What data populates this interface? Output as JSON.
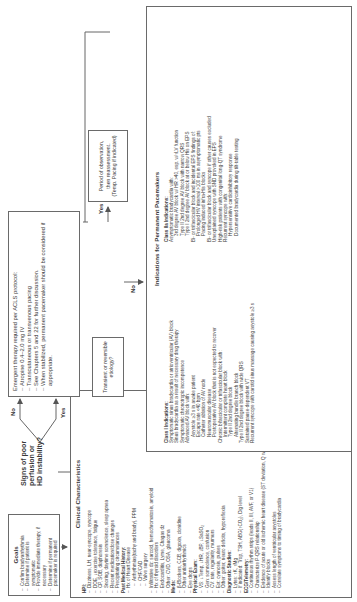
{
  "goals": {
    "title": "Goals",
    "items": [
      "Confirm bradyarrhythmia",
      "Determine if patient is symptomatic",
      "Provide immediate therapy, if necessary",
      "Determine if permanent pacemaker is required"
    ]
  },
  "clinical": {
    "title": "Clinical Characteristics",
    "hpi_label": "HPI:",
    "hpi": [
      "Dizziness, LH, near-syncope, syncope",
      "DOE, ↓exercise tolerance, fatigue",
      "CP, SOB, diaphoresis",
      "Snoring, daytime somnolence, sleep apnea",
      "Recent medication/dose changes",
      "Precipitating circumstances"
    ],
    "pmh_label": "Past Medical History:",
    "pmh": [
      {
        "t": "Hx of Heart Disease",
        "lvl": 1
      },
      {
        "t": "Arrhythmias(tachy and brady), PPM",
        "lvl": 2
      },
      {
        "t": "CHF/CAD",
        "lvl": 2
      },
      {
        "t": "Valve surgery",
        "lvl": 2
      },
      {
        "t": "Infiltrative dz: sarcoid, hemochromatosis, amyloid",
        "lvl": 1
      },
      {
        "t": "Hx of thyroid disorders",
        "lvl": 1
      },
      {
        "t": "Endocarditis, Lyme, Chagas dz",
        "lvl": 1
      },
      {
        "t": "Other: CVD, OSA, glaucoma",
        "lvl": 1
      }
    ],
    "meds_label": "Meds:",
    "meds": [
      "β-Blockers, CCB, digoxin, clonidine",
      "Other antiarrhythmics",
      "Eye drops"
    ],
    "exam_label": "Physical Exam:",
    "exam": [
      "VS: ↓Temp, ↓HR, ↓BP, ↓SaSO₂",
      "Gen: somnolence, confusion",
      "CV: rate, regularity, murmurs",
      "Ext: cyanosis, pulses",
      "Other: goiter, neuro deficits, hyporeflexia"
    ],
    "dx_label": "Diagnostic Studies:",
    "dx": [
      "Lytes: ↑K, ↑Mg",
      "If indicated: Trop, TSH, ABG(↑CO₂), Dig level"
    ],
    "ecg_label": "ECG/Telemetry:",
    "ecg": [
      "Continuous rhythm strips (leads II, III, AVF, or V1)",
      "Characterize P-QRS relationship",
      "Evidence of acute or old ischemic heart disease (ST deviation, Q waves)",
      "Identify blocks",
      "Assess length of ventricular asystoles",
      "Correlate symptoms to timing of bradycardia"
    ]
  },
  "decision": {
    "question": [
      "Signs of poor",
      "perfusion or",
      "HD instability?"
    ],
    "yes_label": "Yes",
    "no_label": "No"
  },
  "emergent": {
    "lead": "Emergent therapy required per ACLS protocol:",
    "items": [
      "Atropine 0.4–2.0 mg IV",
      "Transcutaneous or transvenous pacing",
      "See Chapters 5 and 22 for further discussion.",
      "When stabilized, permanent pacemaker should be considered if appropriate."
    ]
  },
  "transient": {
    "question": "Transient or reversible etiology?",
    "yes_label": "Yes",
    "no_label": "No"
  },
  "observation": {
    "text": [
      "Period of observation,",
      "then reassessment.",
      "(Temp. Pacing if indicated)"
    ]
  },
  "indications": {
    "title": "Indications for Permanent Pacemakers",
    "class1_label": "Class I Indications:",
    "class1": [
      {
        "t": "Symptomatic sinus bradycardia or atrioventricular (AV) block",
        "lvl": 0
      },
      {
        "t": "Sinus bradycardia as a result of necessary drug therapy",
        "lvl": 0
      },
      {
        "t": "Symptomatic chronotropic incompetence",
        "lvl": 0
      },
      {
        "t": "Advanced AV block with:",
        "lvl": 0
      },
      {
        "t": "Asystole ≥3 s in awake patient",
        "lvl": 1
      },
      {
        "t": "Escape rate <40 bpm",
        "lvl": 1
      },
      {
        "t": "Catheter ablation of AV node",
        "lvl": 1
      },
      {
        "t": "Neuromuscular disease",
        "lvl": 1
      },
      {
        "t": "Postoperative AV block that is not expected to recover",
        "lvl": 1
      },
      {
        "t": "Chronic bifascicular or trifascicular block with:",
        "lvl": 0
      },
      {
        "t": "Intermittent complete heart block",
        "lvl": 1
      },
      {
        "t": "Type II 2nd degree block",
        "lvl": 1
      },
      {
        "t": "Alternating bundle branch block",
        "lvl": 1
      },
      {
        "t": "Type II 2nd degree block with wide QRS",
        "lvl": 0
      },
      {
        "t": "Sustained pause-dependent VT",
        "lvl": 0
      },
      {
        "t": "Recurrent syncope with carotid sinus massage causing asystole ≥3 s",
        "lvl": 0
      }
    ],
    "class2a_label": "Class IIa Indications:",
    "class2a": [
      {
        "t": "Asymptomatic bradycardia with:",
        "lvl": 0
      },
      {
        "t": "3rd degree AV block w/ HR >40, esp. w/↑LV function",
        "lvl": 1
      },
      {
        "t": "Type II 2nd degree AV block with narrow QRS",
        "lvl": 1
      },
      {
        "t": "Type I 2nd degree AV block at or below His on EPS",
        "lvl": 1
      },
      {
        "t": "Bi- or trifascicular block and incidental EPS findings of:",
        "lvl": 0
      },
      {
        "t": "Prolonged HV interval >100 ms in asymptomatic pts",
        "lvl": 1
      },
      {
        "t": "Pacing induced infra-His blocks",
        "lvl": 1
      },
      {
        "t": "Bi- or trifascicular block and syncope if other causes excluded",
        "lvl": 0
      },
      {
        "t": "Unexplained syncope with SND provoked in EPS",
        "lvl": 0
      },
      {
        "t": "High-risk patients with congenital long-QT syndrome",
        "lvl": 0
      },
      {
        "t": "Recurrent syncope with:",
        "lvl": 0
      },
      {
        "t": "Hypersensitive cardioinhibitory response",
        "lvl": 1
      },
      {
        "t": "Documented bradycardia during tilt-table testing",
        "lvl": 1
      }
    ]
  }
}
